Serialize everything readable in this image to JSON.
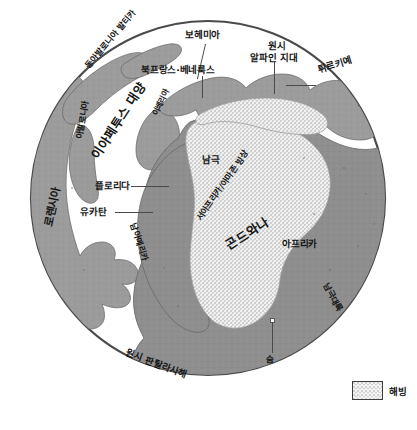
{
  "figure": {
    "type": "paleogeographic-globe-map",
    "caption_text": null
  },
  "globe": {
    "name": "globe-disc",
    "ocean_color": "#ffffff",
    "outline_color": "#4a4a4a",
    "landmass_color": "#9a9a9a",
    "ice_sheet_color": "#efefef",
    "ice_stipple_color": "#8d8d8d"
  },
  "labels": {
    "bohemia": "보헤미아",
    "north_france_benelux": "북프랑스·베네룩스",
    "proto_alpine_line1": "원시",
    "proto_alpine_line2": "알파인 지대",
    "turkiye": "튀르키예",
    "east_avalonia_baltica": "동아발로니아 발티카",
    "iapetus_ocean": "이아페투스 대양",
    "avalonia": "아발로니아",
    "iberia": "이베리아",
    "florida": "플로리다",
    "yucatan": "유카탄",
    "laurentia": "로렌시아",
    "south_pole": "남극",
    "west_africa_amazon_ice_sheet": "서아프리카/아마존 빙상",
    "gondwana": "곤드와나",
    "africa": "아프리카",
    "south_america": "남아메리카",
    "antarctica": "남극대륙",
    "proto_panthalassa_sea": "원시 판탈라사해",
    "sum": "숨"
  },
  "legend": {
    "swatch_name": "sea-ice-swatch",
    "label": "해빙"
  }
}
